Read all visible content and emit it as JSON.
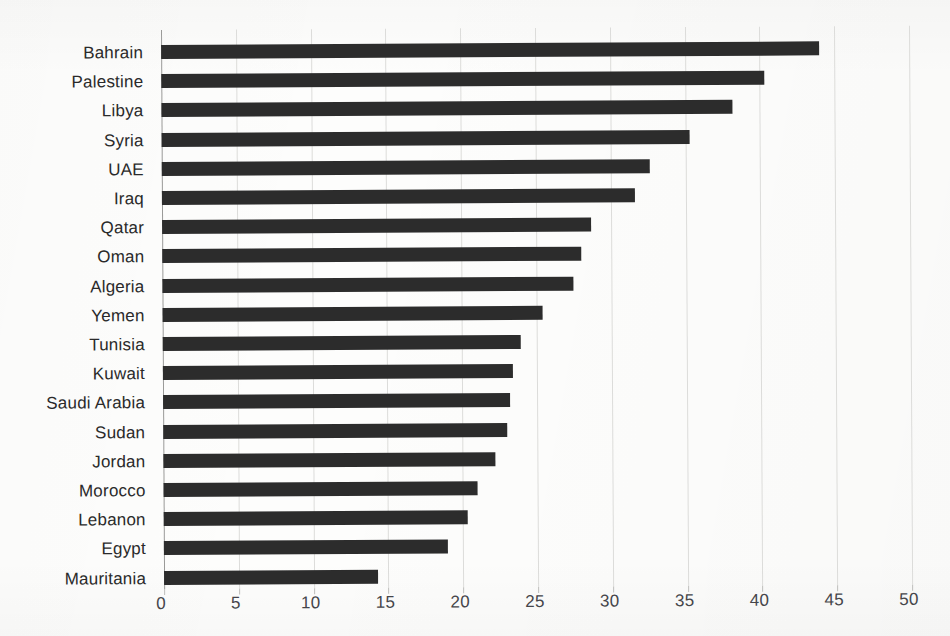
{
  "chart_data": {
    "type": "bar",
    "orientation": "horizontal",
    "title": "",
    "subtitle": "",
    "xlabel": "",
    "ylabel": "",
    "xlim": [
      0,
      50
    ],
    "xticks": [
      "0",
      "5",
      "10",
      "15",
      "20",
      "25",
      "30",
      "35",
      "40",
      "45",
      "50"
    ],
    "xtick_values": [
      0,
      5,
      10,
      15,
      20,
      25,
      30,
      35,
      40,
      45,
      50
    ],
    "grid": true,
    "legend": false,
    "bar_color": "#2c2c2c",
    "gridline_color": "#dcdcda",
    "categories": [
      "Bahrain",
      "Palestine",
      "Libya",
      "Syria",
      "UAE",
      "Iraq",
      "Qatar",
      "Oman",
      "Algeria",
      "Yemen",
      "Tunisia",
      "Kuwait",
      "Saudi  Arabia",
      "Sudan",
      "Jordan",
      "Morocco",
      "Lebanon",
      "Egypt",
      "Mauritania"
    ],
    "values": [
      44.0,
      40.3,
      38.2,
      35.3,
      32.6,
      31.6,
      28.7,
      28.0,
      27.5,
      25.4,
      23.9,
      23.4,
      23.2,
      23.0,
      22.2,
      21.0,
      20.3,
      19.0,
      14.3
    ]
  }
}
